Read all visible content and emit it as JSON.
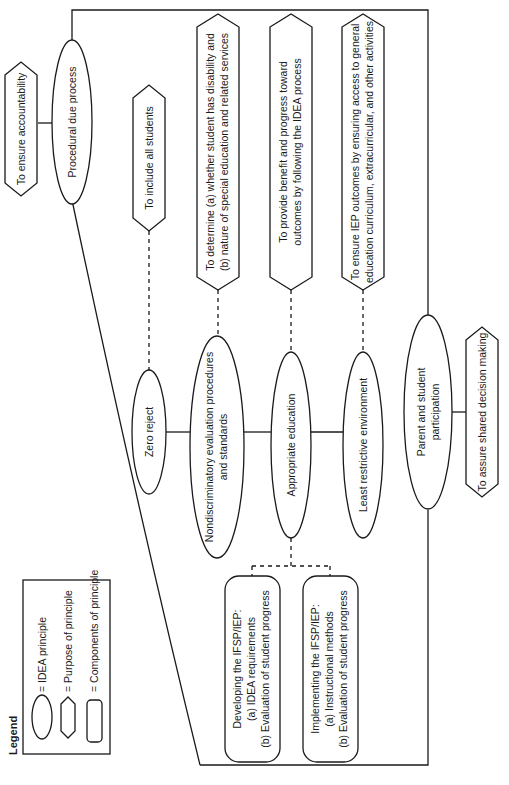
{
  "legend": {
    "title": "Legend",
    "items": [
      {
        "shape": "ellipse",
        "label": "= IDEA principle"
      },
      {
        "shape": "hexagon",
        "label": "= Purpose of principle"
      },
      {
        "shape": "rounded-rectangle",
        "label": "= Components of principle"
      }
    ]
  },
  "principles": {
    "procedural": {
      "label": "Procedural due process",
      "purpose": "To ensure accountability"
    },
    "zero_reject": {
      "label": "Zero reject",
      "purpose": "To include all students"
    },
    "nondiscriminatory": {
      "label_line1": "Nondiscriminatory evaluation procedures",
      "label_line2": "and standards",
      "purpose_line1": "To determine (a) whether student has disability and",
      "purpose_line2": "(b) nature of special education and related services"
    },
    "appropriate": {
      "label": "Appropriate education",
      "purpose_line1": "To provide benefit and progress toward",
      "purpose_line2": "outcomes by following the IDEA process",
      "components": [
        {
          "line1": "Developing the IFSP/IEP:",
          "line2": "(a) IDEA requirements",
          "line3": "(b) Evaluation of student progress"
        },
        {
          "line1": "Implementing the IFSP/IEP:",
          "line2": "(a) Instructional methods",
          "line3": "(b) Evaluation of student progress"
        }
      ]
    },
    "lre": {
      "label": "Least restrictive environment",
      "purpose_line1": "To ensure IEP outcomes by ensuring access to general",
      "purpose_line2": "education curriculum, extracurricular, and other activities"
    },
    "parent": {
      "label_line1": "Parent and student",
      "label_line2": "participation",
      "purpose": "To assure shared decision making"
    }
  },
  "colors": {
    "stroke": "#1a1a1a",
    "background": "#ffffff"
  }
}
